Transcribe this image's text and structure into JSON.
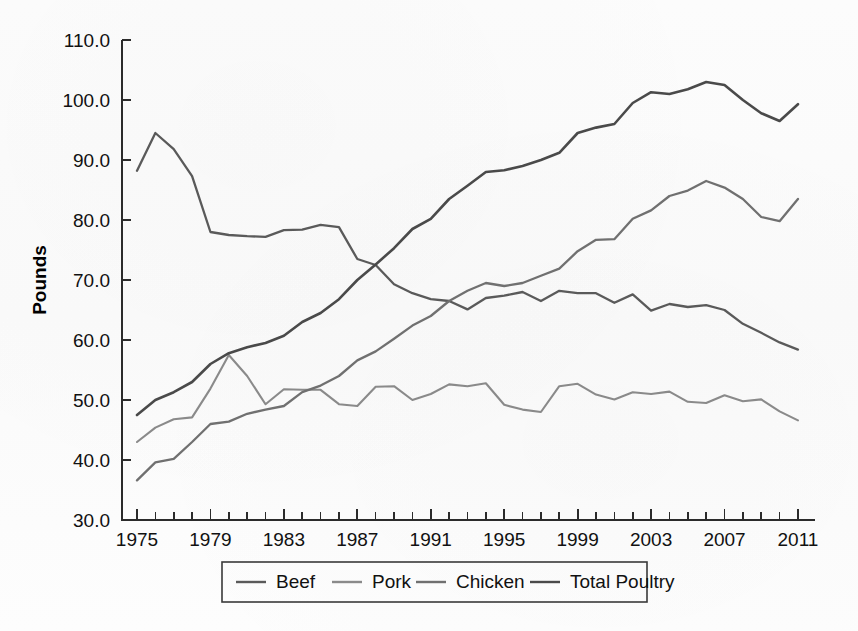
{
  "chart_data": {
    "type": "line",
    "title": "",
    "xlabel": "",
    "ylabel": "Pounds",
    "xlim": [
      1974,
      2012
    ],
    "ylim": [
      30.0,
      110.0
    ],
    "grid": false,
    "legend_position": "bottom",
    "x": [
      1975,
      1976,
      1977,
      1978,
      1979,
      1980,
      1981,
      1982,
      1983,
      1984,
      1985,
      1986,
      1987,
      1988,
      1989,
      1990,
      1991,
      1992,
      1993,
      1994,
      1995,
      1996,
      1997,
      1998,
      1999,
      2000,
      2001,
      2002,
      2003,
      2004,
      2005,
      2006,
      2007,
      2008,
      2009,
      2010,
      2011
    ],
    "y_ticks": [
      "30.0",
      "40.0",
      "50.0",
      "60.0",
      "70.0",
      "80.0",
      "90.0",
      "100.0",
      "110.0"
    ],
    "x_tick_labels": [
      "1975",
      "1979",
      "1983",
      "1987",
      "1991",
      "1995",
      "1999",
      "2003",
      "2007",
      "2011"
    ],
    "series": [
      {
        "name": "Beef",
        "color": "#5a5a5a",
        "values": [
          88.2,
          94.5,
          91.8,
          87.3,
          78.0,
          77.5,
          77.3,
          77.2,
          78.3,
          78.4,
          79.2,
          78.8,
          73.5,
          72.5,
          69.3,
          67.8,
          66.8,
          66.5,
          65.1,
          67.0,
          67.4,
          68.0,
          66.5,
          68.2,
          67.8,
          67.8,
          66.2,
          67.6,
          64.9,
          66.0,
          65.5,
          65.8,
          65.0,
          62.7,
          61.2,
          59.6,
          58.4
        ]
      },
      {
        "name": "Pork",
        "color": "#8a8a8a",
        "values": [
          43.0,
          45.4,
          46.8,
          47.1,
          51.9,
          57.5,
          54.0,
          49.3,
          51.8,
          51.7,
          51.7,
          49.3,
          49.0,
          52.2,
          52.3,
          50.0,
          51.0,
          52.6,
          52.3,
          52.8,
          49.2,
          48.4,
          48.0,
          52.3,
          52.7,
          50.9,
          50.1,
          51.3,
          51.0,
          51.4,
          49.7,
          49.5,
          50.8,
          49.8,
          50.1,
          48.1,
          46.6
        ]
      },
      {
        "name": "Chicken",
        "color": "#707070",
        "values": [
          36.6,
          39.6,
          40.2,
          43.0,
          46.0,
          46.4,
          47.7,
          48.4,
          49.0,
          51.3,
          52.4,
          54.0,
          56.6,
          58.1,
          60.2,
          62.4,
          64.0,
          66.5,
          68.2,
          69.5,
          69.0,
          69.5,
          70.7,
          71.9,
          74.8,
          76.7,
          76.8,
          80.2,
          81.6,
          84.0,
          84.9,
          86.5,
          85.4,
          83.5,
          80.5,
          79.8,
          83.5
        ]
      },
      {
        "name": "Total Poultry",
        "color": "#4a4a4a",
        "values": [
          47.5,
          50.0,
          51.3,
          53.0,
          56.0,
          57.8,
          58.8,
          59.5,
          60.7,
          63.0,
          64.5,
          66.8,
          70.0,
          72.6,
          75.3,
          78.5,
          80.2,
          83.5,
          85.7,
          88.0,
          88.3,
          89.0,
          90.0,
          91.2,
          94.5,
          95.4,
          96.0,
          99.5,
          101.3,
          101.0,
          101.8,
          103.0,
          102.5,
          100.0,
          97.8,
          96.5,
          99.3
        ]
      }
    ],
    "legend_entries": [
      "Beef",
      "Pork",
      "Chicken",
      "Total Poultry"
    ]
  },
  "axis": {
    "y_label": "Pounds"
  }
}
